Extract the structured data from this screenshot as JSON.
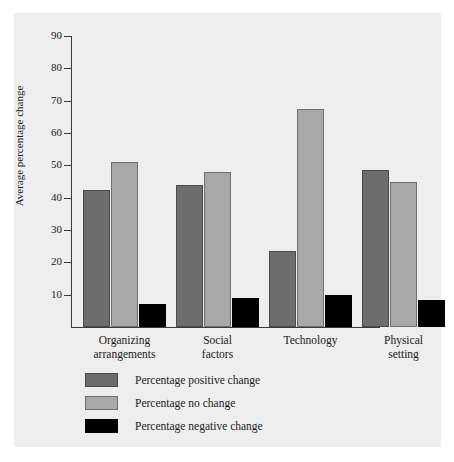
{
  "chart_data": {
    "type": "bar",
    "title": "",
    "subtitle": "",
    "xlabel": "",
    "ylabel": "Average percentage change",
    "ylim": [
      0,
      90
    ],
    "ytick_labels": [
      "90",
      "80",
      "70",
      "60",
      "50",
      "40",
      "30",
      "20",
      "10"
    ],
    "ytick_values": [
      90,
      80,
      70,
      60,
      50,
      40,
      30,
      20,
      10
    ],
    "grid": false,
    "legend_position": "below-plot-left",
    "categories": [
      "Organizing arrangements",
      "Social factors",
      "Technology",
      "Physical setting"
    ],
    "category_lines": [
      [
        "Organizing",
        "arrangements"
      ],
      [
        "Social",
        "factors"
      ],
      [
        "Technology",
        ""
      ],
      [
        "Physical",
        "setting"
      ]
    ],
    "series": [
      {
        "name": "Percentage positive change",
        "color": "#6d6d6d",
        "values": [
          42.5,
          44,
          23.5,
          48.5
        ]
      },
      {
        "name": "Percentage no change",
        "color": "#a8a8a8",
        "values": [
          51,
          48,
          67.5,
          45
        ]
      },
      {
        "name": "Percentage negative change",
        "color": "#000000",
        "values": [
          7,
          9,
          10,
          8.5
        ]
      }
    ]
  },
  "axis": {
    "y_label": "Average percentage change"
  },
  "legend": {
    "items": [
      {
        "label": "Percentage positive change",
        "swatch": "positive"
      },
      {
        "label": "Percentage no change",
        "swatch": "neutral"
      },
      {
        "label": "Percentage negative change",
        "swatch": "negative"
      }
    ]
  },
  "colors": {
    "page_background": "#ffffff",
    "panel_background": "#eeeeee",
    "axis": "#3a3a3a",
    "text": "#1a1a1a",
    "positive": "#6d6d6d",
    "neutral": "#a8a8a8",
    "negative": "#000000"
  }
}
